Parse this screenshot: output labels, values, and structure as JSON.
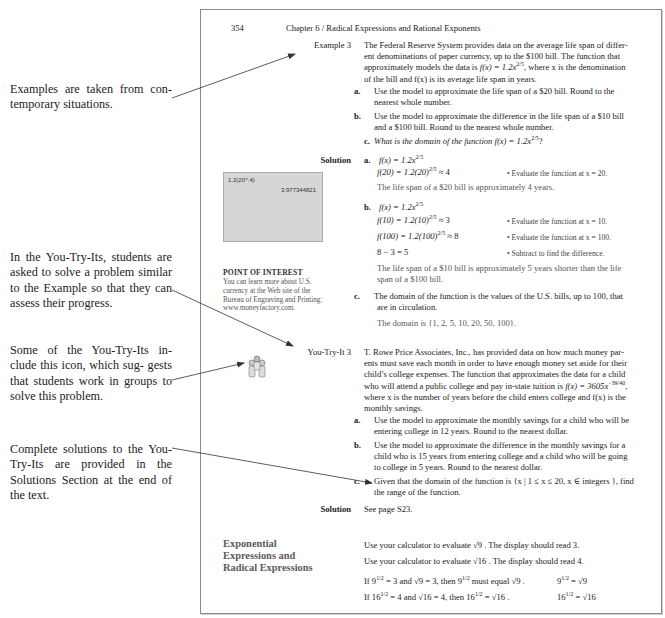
{
  "margin_notes": [
    {
      "text": "Examples are taken from con- temporary situations."
    },
    {
      "text": "In the You-Try-Its, students are asked to solve a problem similar to the Example so that they can assess their progress."
    },
    {
      "text": "Some of the You-Try-Its in- clude this icon, which sug- gests that students work in groups to solve this problem."
    },
    {
      "text": "Complete solutions to the You-Try-Its are provided in the Solutions Section at the end of the text."
    }
  ],
  "page": {
    "number": "354",
    "running_head": "Chapter 6 / Radical Expressions and Rational Exponents",
    "example": {
      "label": "Example 3",
      "intro_1": "The Federal Reserve System provides data on the average life span of differ-",
      "intro_2": "ent denominations of paper currency, up to the $100 bill. The function that",
      "intro_3a": "approximately models the data is ",
      "intro_3_func": "f(x) = 1.2x",
      "intro_3_exp": "2/5",
      "intro_3b": ", where x is the denomination",
      "intro_4": "of the bill and f(x) is its average life span in years.",
      "parts": [
        {
          "letter": "a.",
          "line1": "Use the model to approximate the life span of a $20 bill. Round to the",
          "line2": "nearest whole number."
        },
        {
          "letter": "b.",
          "line1": "Use the model to approximate the difference in the life span of a $10 bill",
          "line2": "and a $100 bill. Round to the nearest whole number."
        },
        {
          "letter": "c.",
          "line1": "What is the domain of the function f(x) = 1.2x",
          "exp": "2/5",
          "tail": "?"
        }
      ]
    },
    "solution": {
      "label": "Solution",
      "a": {
        "letter": "a.",
        "eq1": "f(x) = 1.2x",
        "eq1_exp": "2/5",
        "eq2": "f(20) = 1.2(20)",
        "eq2_exp": "2/5",
        "eq2_tail": " ≈ 4",
        "comment": "• Evaluate the function at x = 20.",
        "conclusion": "The life span of a $20 bill is approximately 4 years."
      },
      "b": {
        "letter": "b.",
        "eq1": "f(x) = 1.2x",
        "eq1_exp": "2/5",
        "eq2": "f(10) = 1.2(10)",
        "eq2_exp": "2/5",
        "eq2_tail": " ≈ 3",
        "comment2": "• Evaluate the function at x = 10.",
        "eq3": "f(100) = 1.2(100)",
        "eq3_exp": "2/5",
        "eq3_tail": " ≈ 8",
        "comment3": "• Evaluate the function at x = 100.",
        "eq4": "8 − 3 = 5",
        "comment4": "• Subtract to find the difference.",
        "conclusion_1": "The life span of a $10 bill is approximately 5 years shorter than the life",
        "conclusion_2": "span of a $100 bill."
      },
      "c": {
        "letter": "c.",
        "line1": "The domain of the function is the values of the U.S. bills, up to 100, that",
        "line2": "are in circulation.",
        "conclusion": "The domain is {1, 2, 5, 10, 20, 50, 100}."
      }
    },
    "calculator": {
      "input": "1.2(20^.4)",
      "output": "3.977344821"
    },
    "point_of_interest": {
      "title": "POINT OF INTEREST",
      "body": "You can learn more about U.S. currency at the Web site of the Bureau of Engraving and Printing: www.moneyfactory.com."
    },
    "you_try_it": {
      "label": "You-Try-It 3",
      "icon": "group-work-icon",
      "intro_1": "T. Rowe Price Associates, Inc., has provided data on how much money par-",
      "intro_2": "ents must save each month in order to have enough money set aside for their",
      "intro_3": "child’s college expenses. The function that approximates the data for a child",
      "intro_4a": "who will attend a public college and pay in-state tuition is ",
      "intro_4_func": "f(x) = 3605x",
      "intro_4_exp": "−39/40",
      "intro_4b": ",",
      "intro_5": "where x is the number of years before the child enters college and f(x) is the",
      "intro_6": "monthly savings.",
      "parts": [
        {
          "letter": "a.",
          "line1": "Use the model to approximate the monthly savings for a child who will be",
          "line2": "entering college in 12 years. Round to the nearest dollar."
        },
        {
          "letter": "b.",
          "line1": "Use the model to approximate the difference in the monthly savings for a",
          "line2": "child who is 15 years from entering college and a child who will be going",
          "line3": "to college in 5 years. Round to the nearest dollar."
        },
        {
          "letter": "c.",
          "line1": "Given that the domain of the function is {x | 1 ≤ x ≤ 20, x ∈ integers }, find",
          "line2": "the range of the function."
        }
      ],
      "solution_label": "Solution",
      "solution_text": "See page S23."
    },
    "section": {
      "heading_1": "Exponential",
      "heading_2": "Expressions and",
      "heading_3": "Radical Expressions",
      "line1": "Use your calculator to evaluate √9 . The display should read 3.",
      "line2": "Use your calculator to evaluate √16 . The display should read 4.",
      "line3a": "If 9",
      "line3_exp": "1/2",
      "line3b": " = 3 and √9 = 3, then 9",
      "line3_exp2": "1/2",
      "line3c": " must equal √9 .",
      "line4a": "If 16",
      "line4_exp": "1/2",
      "line4b": " = 4 and √16 = 4, then 16",
      "line4_exp2": "1/2",
      "line4c": " = √16 .",
      "result1a": "9",
      "result1_exp": "1/2",
      "result1b": " = √9",
      "result2a": "16",
      "result2_exp": "1/2",
      "result2b": " = √16"
    }
  },
  "colors": {
    "page_border": "#8a8a8a",
    "calculator_screen": "#d6d6d6",
    "section_heading": "#5a5a5a",
    "arrow": "#333333"
  }
}
